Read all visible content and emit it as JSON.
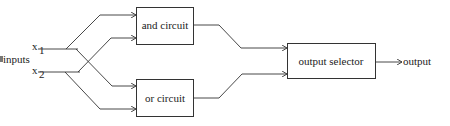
{
  "diagram": {
    "inputs_label": "inputs",
    "input_1": "x",
    "input_1_sub": "1",
    "input_2": "x",
    "input_2_sub": "2",
    "and_box": "and circuit",
    "or_box": "or circuit",
    "selector_box": "output selector",
    "output_label": "output",
    "stroke_color": "#333333"
  }
}
